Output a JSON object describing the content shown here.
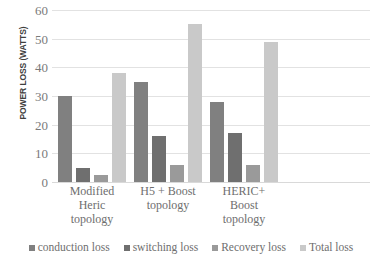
{
  "chart_data": {
    "type": "bar",
    "title": "",
    "subtitle": "",
    "xlabel": "",
    "ylabel": "POWER LOSS (WATTS)",
    "ylim": [
      0,
      60
    ],
    "yticks": [
      0,
      10,
      20,
      30,
      40,
      50,
      60
    ],
    "grid": true,
    "legend_position": "bottom",
    "categories": [
      "Modified Heric topology",
      "H5 + Boost topology",
      "HERIC+ Boost topology"
    ],
    "category_lines": [
      [
        "Modified",
        "Heric",
        "topology"
      ],
      [
        "H5 + Boost",
        "topology"
      ],
      [
        "HERIC+",
        "Boost",
        "topology"
      ]
    ],
    "series": [
      {
        "name": "conduction loss",
        "color": "#808080",
        "values": [
          30,
          35,
          28
        ]
      },
      {
        "name": "switching loss",
        "color": "#6f6f6f",
        "values": [
          5,
          16,
          17
        ]
      },
      {
        "name": "Recovery loss",
        "color": "#9a9a9a",
        "values": [
          2.5,
          6,
          6
        ]
      },
      {
        "name": "Total loss",
        "color": "#c9c9c9",
        "values": [
          38,
          55,
          49
        ]
      }
    ]
  },
  "axis": {
    "tick_labels": [
      "60",
      "50",
      "40",
      "30",
      "20",
      "10",
      "0"
    ]
  },
  "colors": {
    "gridline": "#e2e2e2",
    "tick_text": "#7a7a7a",
    "label_text": "#6e6e6e",
    "axis_title_text": "#3f3f3f",
    "background": "#ffffff"
  }
}
